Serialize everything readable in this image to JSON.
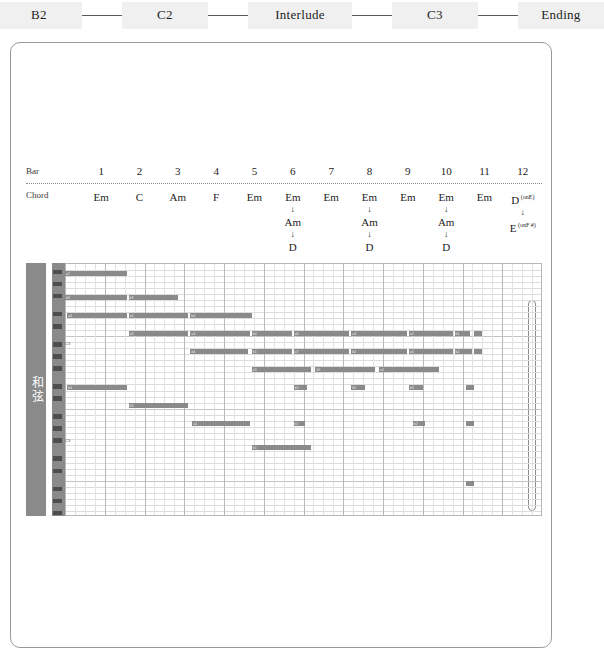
{
  "section_strip": {
    "items": [
      {
        "label": "B2",
        "type": "chip"
      },
      {
        "label": "C2",
        "type": "chip"
      },
      {
        "label": "Interlude",
        "type": "chip"
      },
      {
        "label": "C3",
        "type": "chip"
      },
      {
        "label": "Ending",
        "type": "chip"
      }
    ],
    "separator": "—"
  },
  "chord_table": {
    "row_label_bar": "Bar",
    "row_label_chord": "Chord",
    "arrow_glyph": "↓",
    "bars": [
      {
        "num": "1",
        "chords": [
          "Em"
        ],
        "sup": [
          ""
        ]
      },
      {
        "num": "2",
        "chords": [
          "C"
        ],
        "sup": [
          ""
        ]
      },
      {
        "num": "3",
        "chords": [
          "Am"
        ],
        "sup": [
          ""
        ]
      },
      {
        "num": "4",
        "chords": [
          "F"
        ],
        "sup": [
          ""
        ]
      },
      {
        "num": "5",
        "chords": [
          "Em"
        ],
        "sup": [
          ""
        ]
      },
      {
        "num": "6",
        "chords": [
          "Em",
          "Am",
          "D"
        ],
        "sup": [
          "",
          "",
          ""
        ]
      },
      {
        "num": "7",
        "chords": [
          "Em"
        ],
        "sup": [
          ""
        ]
      },
      {
        "num": "8",
        "chords": [
          "Em",
          "Am",
          "D"
        ],
        "sup": [
          "",
          "",
          ""
        ]
      },
      {
        "num": "9",
        "chords": [
          "Em"
        ],
        "sup": [
          ""
        ]
      },
      {
        "num": "10",
        "chords": [
          "Em",
          "Am",
          "D"
        ],
        "sup": [
          "",
          "",
          ""
        ]
      },
      {
        "num": "11",
        "chords": [
          "Em"
        ],
        "sup": [
          ""
        ]
      },
      {
        "num": "12",
        "chords": [
          "D",
          "E"
        ],
        "sup": [
          "(onE)",
          "(onF #)"
        ]
      }
    ]
  },
  "track": {
    "name": "和弦"
  },
  "piano_roll": {
    "bars_count": 12,
    "beats_per_bar": 4,
    "rows_count": 42,
    "octave_labels": [
      "C3",
      "C3"
    ],
    "note_color": "#8a8a8a",
    "grid_color": "#dcdcdc",
    "notes": [
      {
        "row": 1,
        "start": 0.0,
        "len": 1.55,
        "label": "a7"
      },
      {
        "row": 5,
        "start": 0.0,
        "len": 1.55,
        "label": "b3"
      },
      {
        "row": 5,
        "start": 1.6,
        "len": 1.25,
        "label": "b3"
      },
      {
        "row": 8,
        "start": 0.05,
        "len": 1.5,
        "label": "a4"
      },
      {
        "row": 8,
        "start": 1.6,
        "len": 1.5,
        "label": "a4"
      },
      {
        "row": 8,
        "start": 3.15,
        "len": 1.55,
        "label": "b4"
      },
      {
        "row": 11,
        "start": 1.6,
        "len": 1.5,
        "label": "a3"
      },
      {
        "row": 11,
        "start": 3.15,
        "len": 1.5,
        "label": "a3"
      },
      {
        "row": 11,
        "start": 4.7,
        "len": 1.0,
        "label": "b4"
      },
      {
        "row": 11,
        "start": 5.75,
        "len": 1.4,
        "label": "a6"
      },
      {
        "row": 11,
        "start": 7.2,
        "len": 1.4,
        "label": "a4"
      },
      {
        "row": 11,
        "start": 8.65,
        "len": 1.1,
        "label": "a2"
      },
      {
        "row": 11,
        "start": 9.8,
        "len": 0.4,
        "label": "b1"
      },
      {
        "row": 11,
        "start": 10.3,
        "len": 0.2,
        "label": ""
      },
      {
        "row": 14,
        "start": 3.15,
        "len": 1.45,
        "label": "a6"
      },
      {
        "row": 14,
        "start": 4.7,
        "len": 1.0,
        "label": "b1"
      },
      {
        "row": 14,
        "start": 5.75,
        "len": 1.4,
        "label": "a7"
      },
      {
        "row": 14,
        "start": 7.2,
        "len": 1.4,
        "label": "b2"
      },
      {
        "row": 14,
        "start": 8.65,
        "len": 1.1,
        "label": "a3"
      },
      {
        "row": 14,
        "start": 9.8,
        "len": 0.45,
        "label": "b2"
      },
      {
        "row": 14,
        "start": 10.3,
        "len": 0.2,
        "label": ""
      },
      {
        "row": 17,
        "start": 4.7,
        "len": 1.5,
        "label": "a5"
      },
      {
        "row": 17,
        "start": 6.3,
        "len": 1.5,
        "label": "b5"
      },
      {
        "row": 17,
        "start": 7.9,
        "len": 1.5,
        "label": "a5"
      },
      {
        "row": 20,
        "start": 0.05,
        "len": 1.5,
        "label": "b4"
      },
      {
        "row": 20,
        "start": 5.75,
        "len": 0.35,
        "label": "b3"
      },
      {
        "row": 20,
        "start": 7.2,
        "len": 0.35,
        "label": "b5"
      },
      {
        "row": 20,
        "start": 8.65,
        "len": 0.35,
        "label": "b3"
      },
      {
        "row": 20,
        "start": 10.1,
        "len": 0.2,
        "label": ""
      },
      {
        "row": 23,
        "start": 1.6,
        "len": 1.5,
        "label": "b3"
      },
      {
        "row": 26,
        "start": 3.2,
        "len": 1.45,
        "label": "a1"
      },
      {
        "row": 26,
        "start": 5.75,
        "len": 0.3,
        "label": "b1"
      },
      {
        "row": 26,
        "start": 8.75,
        "len": 0.3,
        "label": "b2"
      },
      {
        "row": 26,
        "start": 10.1,
        "len": 0.2,
        "label": ""
      },
      {
        "row": 30,
        "start": 4.7,
        "len": 1.5,
        "label": "b1"
      },
      {
        "row": 36,
        "start": 10.1,
        "len": 0.2,
        "label": ""
      }
    ],
    "highlight": {
      "start_bar": 11.65,
      "label": "highlight-region"
    }
  }
}
